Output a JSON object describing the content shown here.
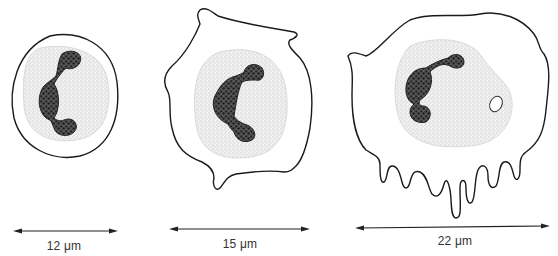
{
  "figure": {
    "cells": [
      {
        "id": "cell-1",
        "size_label": "12 μm",
        "size_um": 12,
        "shape": "round, smooth outline"
      },
      {
        "id": "cell-2",
        "size_label": "15 μm",
        "size_um": 15,
        "shape": "irregular with small projections"
      },
      {
        "id": "cell-3",
        "size_label": "22 μm",
        "size_um": 22,
        "shape": "large irregular with finger-like projections and a vacuole"
      }
    ]
  },
  "colors": {
    "line": "#1a1a1a",
    "stipple": "#c8c8c8",
    "background": "#ffffff"
  }
}
